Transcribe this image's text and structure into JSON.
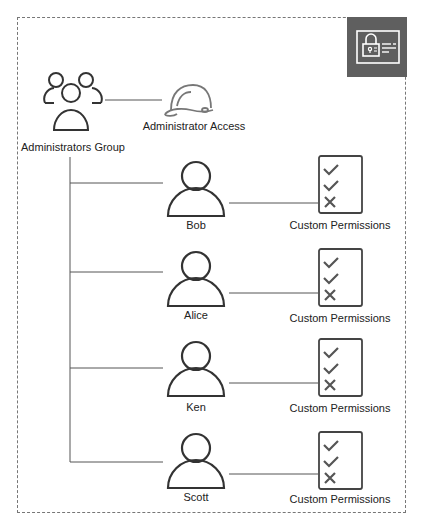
{
  "diagram": {
    "badge": {
      "icon": "permissions-card-lock-icon",
      "color": "#5f5f5f"
    },
    "group": {
      "label": "Administrators Group",
      "icon": "users-group-icon"
    },
    "policy": {
      "label": "Administrator Access",
      "icon": "hard-hat-icon"
    },
    "users": [
      {
        "name": "Bob",
        "permissions_label": "Custom Permissions"
      },
      {
        "name": "Alice",
        "permissions_label": "Custom Permissions"
      },
      {
        "name": "Ken",
        "permissions_label": "Custom Permissions"
      },
      {
        "name": "Scott",
        "permissions_label": "Custom Permissions"
      }
    ],
    "permission_items": [
      "check",
      "check",
      "cross"
    ],
    "colors": {
      "stroke": "#333333",
      "connector": "#555555",
      "border": "#777777"
    }
  }
}
